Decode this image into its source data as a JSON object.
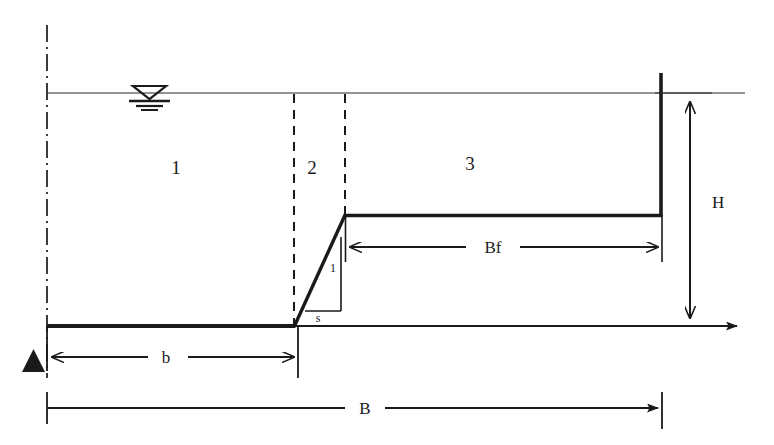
{
  "diagram": {
    "colors": {
      "line": "#1a1a1a",
      "thin_line": "#2b2b2b",
      "background": "#ffffff"
    },
    "regions": [
      {
        "id": "region-1",
        "label": "1",
        "x": 176,
        "y": 174
      },
      {
        "id": "region-2",
        "label": "2",
        "x": 312,
        "y": 174
      },
      {
        "id": "region-3",
        "label": "3",
        "x": 470,
        "y": 170
      }
    ],
    "dimensions": [
      {
        "id": "dim-H",
        "label": "H",
        "x": 708,
        "y": 202,
        "orientation": "vertical",
        "arrows": "double"
      },
      {
        "id": "dim-Bf",
        "label": "Bf",
        "x": 492,
        "y": 253,
        "orientation": "horizontal",
        "arrows": "double"
      },
      {
        "id": "dim-b",
        "label": "b",
        "x": 166,
        "y": 362,
        "orientation": "horizontal",
        "arrows": "double"
      },
      {
        "id": "dim-B",
        "label": "B",
        "x": 365,
        "y": 413,
        "orientation": "horizontal",
        "arrows": "single-right"
      }
    ],
    "slope_indicator": {
      "vertical_label": "1",
      "horizontal_label": "s",
      "vertical_label_x": 330,
      "vertical_label_y": 272,
      "horizontal_label_x": 318,
      "horizontal_label_y": 320
    },
    "symbols": {
      "water_surface": "water-level-triangle",
      "centerline": "dash-dot-centerline",
      "datum_marker": "filled-triangle-support"
    }
  }
}
